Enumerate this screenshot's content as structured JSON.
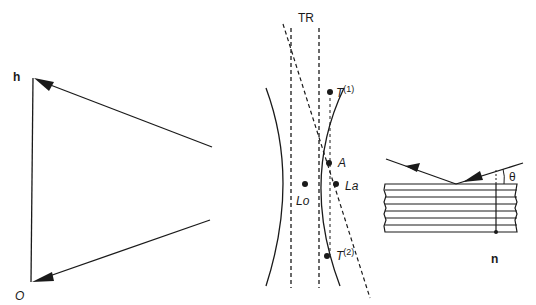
{
  "diagram": {
    "left_panel": {
      "label_h": "h",
      "label_origin": "O"
    },
    "center_panel": {
      "label_TR": "TR",
      "label_T1": "T",
      "label_T1_sup": "(1)",
      "label_A": "A",
      "label_La": "La",
      "label_Lo": "Lo",
      "label_T2": "T",
      "label_T2_sup": "(2)"
    },
    "right_panel": {
      "label_theta": "θ",
      "label_n": "n"
    },
    "colors": {
      "stroke": "#1a1a1a",
      "background": "#ffffff"
    }
  }
}
